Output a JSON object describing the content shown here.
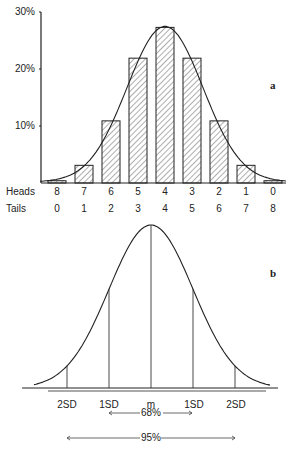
{
  "chart_data": [
    {
      "panel": "a",
      "type": "bar",
      "title": "",
      "xlabel_rows": [
        "Heads",
        "Tails"
      ],
      "categories_heads": [
        "8",
        "7",
        "6",
        "5",
        "4",
        "3",
        "2",
        "1",
        "0"
      ],
      "categories_tails": [
        "0",
        "1",
        "2",
        "3",
        "4",
        "5",
        "6",
        "7",
        "8"
      ],
      "values": [
        0.4,
        3.1,
        10.9,
        21.9,
        27.3,
        21.9,
        10.9,
        3.1,
        0.4
      ],
      "ylabel": "",
      "yticks": [
        "10%",
        "20%",
        "30%"
      ],
      "ylim": [
        0,
        30
      ],
      "overlay": "normal curve",
      "bar_fill": "hatched"
    },
    {
      "panel": "b",
      "type": "line",
      "title": "",
      "description": "Normal distribution curve",
      "x_labels": [
        "2SD",
        "1SD",
        "m",
        "1SD",
        "2SD"
      ],
      "annotations": [
        {
          "label": "68%",
          "from": "-1SD",
          "to": "+1SD"
        },
        {
          "label": "95%",
          "from": "-2SD",
          "to": "+2SD"
        }
      ]
    }
  ],
  "panel_a": {
    "label": "a",
    "yticks": {
      "t10": "10%",
      "t20": "20%",
      "t30": "30%"
    },
    "row_heads": "Heads",
    "row_tails": "Tails",
    "heads": [
      "8",
      "7",
      "6",
      "5",
      "4",
      "3",
      "2",
      "1",
      "0"
    ],
    "tails": [
      "0",
      "1",
      "2",
      "3",
      "4",
      "5",
      "6",
      "7",
      "8"
    ]
  },
  "panel_b": {
    "label": "b",
    "x_labels": [
      "2SD",
      "1SD",
      "m",
      "1SD",
      "2SD"
    ],
    "range68": "68%",
    "range95": "95%"
  }
}
